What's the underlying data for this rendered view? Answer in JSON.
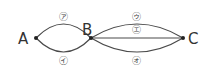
{
  "diagram": {
    "points": [
      {
        "id": "A",
        "label": "A",
        "x": 36,
        "y": 38
      },
      {
        "id": "B",
        "label": "B",
        "x": 91,
        "y": 38
      },
      {
        "id": "C",
        "label": "C",
        "x": 183,
        "y": 38
      }
    ],
    "edges": [
      {
        "id": "a",
        "from": "A",
        "to": "B",
        "label": "㋐",
        "position": "upper"
      },
      {
        "id": "i",
        "from": "A",
        "to": "B",
        "label": "㋑",
        "position": "lower"
      },
      {
        "id": "u",
        "from": "B",
        "to": "C",
        "label": "㋒",
        "position": "upper"
      },
      {
        "id": "e",
        "from": "B",
        "to": "C",
        "label": "㋓",
        "position": "middle"
      },
      {
        "id": "o",
        "from": "B",
        "to": "C",
        "label": "㋔",
        "position": "lower"
      }
    ],
    "colors": {
      "line": "#4a4a4a",
      "text": "#333333"
    }
  }
}
